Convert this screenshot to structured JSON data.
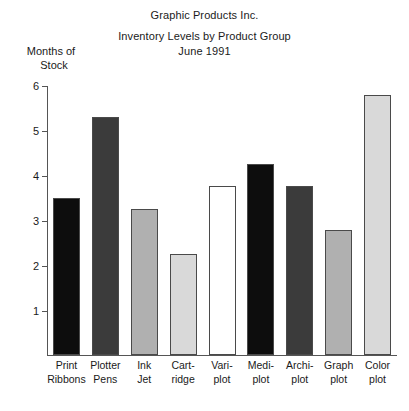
{
  "titles": {
    "company": "Graphic Products Inc.",
    "subject": "Inventory Levels by Product Group",
    "period": "June 1991"
  },
  "axis": {
    "y_caption_line1": "Months of",
    "y_caption_line2": "Stock"
  },
  "chart_data": {
    "type": "bar",
    "title": "Inventory Levels by Product Group",
    "subtitle": "June 1991",
    "supertitle": "Graphic Products Inc.",
    "xlabel": "",
    "ylabel": "Months of Stock",
    "ylim": [
      0,
      6
    ],
    "yticks": [
      1,
      2,
      3,
      4,
      5,
      6
    ],
    "ytick_labels": [
      "1",
      "2",
      "3",
      "4",
      "5",
      "6"
    ],
    "grid": false,
    "legend": "none",
    "categories": [
      "Print Ribbons",
      "Plotter Pens",
      "Ink Jet",
      "Cart-ridge",
      "Vari-plot",
      "Medi-plot",
      "Archi-plot",
      "Graph plot",
      "Color plot"
    ],
    "category_lines": [
      [
        "Print",
        "Ribbons"
      ],
      [
        "Plotter",
        "Pens"
      ],
      [
        "Ink",
        "Jet"
      ],
      [
        "Cart-",
        "ridge"
      ],
      [
        "Vari-",
        "plot"
      ],
      [
        "Medi-",
        "plot"
      ],
      [
        "Archi-",
        "plot"
      ],
      [
        "Graph",
        "plot"
      ],
      [
        "Color",
        "plot"
      ]
    ],
    "values": [
      3.5,
      5.3,
      3.25,
      2.25,
      3.75,
      4.25,
      3.75,
      2.78,
      5.77
    ],
    "bar_colors": [
      "#0d0d0d",
      "#3b3b3b",
      "#b0b0b0",
      "#d9d9d9",
      "#ffffff",
      "#0d0d0d",
      "#3b3b3b",
      "#b0b0b0",
      "#d9d9d9"
    ],
    "bar_edge_color": "#4a4a4a"
  }
}
